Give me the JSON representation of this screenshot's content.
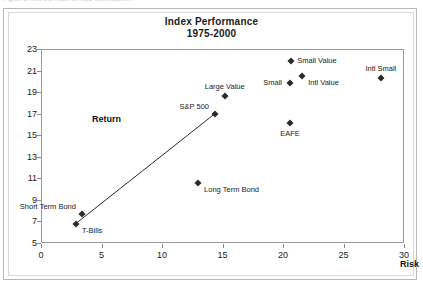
{
  "figure": {
    "caption_fragment": "Figure 1. Risk and return of major asset classes",
    "return_label": "Return",
    "risk_label": "Risk"
  },
  "chart_data": {
    "type": "scatter",
    "title": "Index Performance",
    "subtitle": "1975-2000",
    "xlabel": "Risk",
    "ylabel": "Return",
    "xlim": [
      0,
      30
    ],
    "ylim": [
      5,
      23
    ],
    "xticks": [
      0,
      5,
      10,
      15,
      20,
      25,
      30
    ],
    "yticks": [
      5,
      7,
      9,
      11,
      13,
      15,
      17,
      19,
      21,
      23
    ],
    "grid": false,
    "legend": "none",
    "marker": "diamond",
    "points": [
      {
        "name": "T-Bills",
        "x": 2.8,
        "y": 6.9,
        "label": "T-Bills",
        "label_pos": "right-below"
      },
      {
        "name": "Short Term Bond",
        "x": 3.3,
        "y": 7.8,
        "label": "Short Term Bond",
        "label_pos": "left-above"
      },
      {
        "name": "Long Term Bond",
        "x": 12.9,
        "y": 10.7,
        "label": "Long Term Bond",
        "label_pos": "right-below"
      },
      {
        "name": "S&P 500",
        "x": 14.3,
        "y": 17.1,
        "label": "S&P 500",
        "label_pos": "left-above"
      },
      {
        "name": "Large Value",
        "x": 15.1,
        "y": 18.7,
        "label": "Large Value",
        "label_pos": "above"
      },
      {
        "name": "EAFE",
        "x": 20.5,
        "y": 16.2,
        "label": "EAFE",
        "label_pos": "below"
      },
      {
        "name": "Small",
        "x": 20.5,
        "y": 19.9,
        "label": "Small",
        "label_pos": "left"
      },
      {
        "name": "Small Value",
        "x": 20.6,
        "y": 22.0,
        "label": "Small Value",
        "label_pos": "right"
      },
      {
        "name": "Intl Value",
        "x": 21.5,
        "y": 20.6,
        "label": "Intl Value",
        "label_pos": "right-below"
      },
      {
        "name": "Intl Small",
        "x": 28.0,
        "y": 20.4,
        "label": "Intl Small",
        "label_pos": "above"
      }
    ],
    "line": {
      "name": "capital market line",
      "from": {
        "x": 2.8,
        "y": 6.9
      },
      "to": {
        "x": 14.3,
        "y": 17.1
      },
      "color": "#2b2b2b"
    }
  },
  "colors": {
    "marker": "#2b2b2b",
    "axis": "#9a9a9a",
    "text": "#1a1a1a",
    "frame_outer": "#b9b9b9",
    "frame_inner": "#d8d8d8"
  }
}
